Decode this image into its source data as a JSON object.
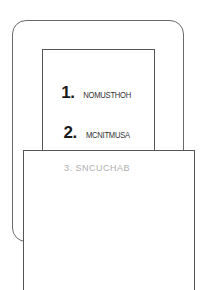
{
  "sketch": {
    "items": [
      {
        "number": "1.",
        "text": "NOMUSTHOH"
      },
      {
        "number": "2.",
        "text": "MCNITMUSA"
      },
      {
        "number": "3.",
        "text": "SNCUCHAB"
      }
    ]
  }
}
